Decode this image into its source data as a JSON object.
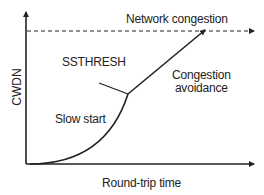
{
  "diagram": {
    "y_axis_label": "CWDN",
    "x_axis_label": "Round-trip time",
    "labels": {
      "network_congestion": "Network congestion",
      "ssthresh": "SSTHRESH",
      "slow_start": "Slow start",
      "congestion_avoidance_line1": "Congestion",
      "congestion_avoidance_line2": "avoidance"
    },
    "colors": {
      "line": "#222222",
      "background": "#ffffff"
    }
  }
}
